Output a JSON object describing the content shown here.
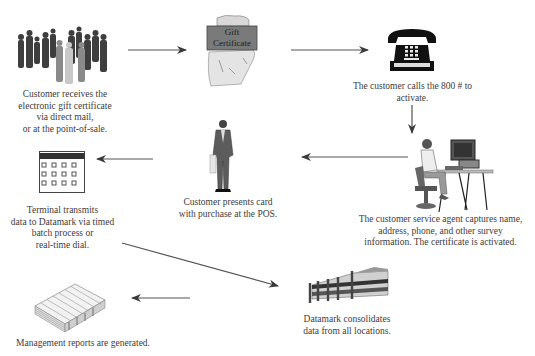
{
  "diagram": {
    "type": "process-flow",
    "colors": {
      "background": "#ffffff",
      "text": "#3c3c3c",
      "arrow": "#444444",
      "certificate_band": "#777777"
    },
    "nodes": [
      {
        "id": "crowd",
        "icon": "crowd-icon",
        "lines": [
          "Customer receives the",
          "electronic gift certificate",
          "via direct mail,",
          "or at the point-of-sale."
        ]
      },
      {
        "id": "gift-certificate",
        "icon": "gift-certificate-icon",
        "badge_lines": [
          "Gift",
          "Certificate"
        ]
      },
      {
        "id": "phone",
        "icon": "telephone-icon",
        "lines": [
          "The customer calls the 800 # to",
          "activate."
        ]
      },
      {
        "id": "agent",
        "icon": "service-agent-icon",
        "lines": [
          "The customer service agent captures name,",
          "address, phone, and other survey",
          "information. The certificate is activated."
        ]
      },
      {
        "id": "customer-pos",
        "icon": "businessman-icon",
        "lines": [
          "Customer presents card",
          "with purchase at the POS."
        ]
      },
      {
        "id": "terminal",
        "icon": "terminal-keypad-icon",
        "lines": [
          "Terminal transmits",
          "data to Datamark via timed",
          "batch process or",
          "real-time dial."
        ]
      },
      {
        "id": "datamark",
        "icon": "building-icon",
        "lines": [
          "Datamark consolidates",
          "data from all locations."
        ]
      },
      {
        "id": "reports",
        "icon": "reports-stack-icon",
        "lines": [
          "Management reports are generated."
        ]
      }
    ],
    "edges": [
      {
        "from": "crowd",
        "to": "gift-certificate"
      },
      {
        "from": "gift-certificate",
        "to": "phone"
      },
      {
        "from": "phone",
        "to": "agent"
      },
      {
        "from": "agent",
        "to": "customer-pos"
      },
      {
        "from": "customer-pos",
        "to": "terminal"
      },
      {
        "from": "terminal",
        "to": "datamark"
      },
      {
        "from": "datamark",
        "to": "reports"
      }
    ]
  }
}
